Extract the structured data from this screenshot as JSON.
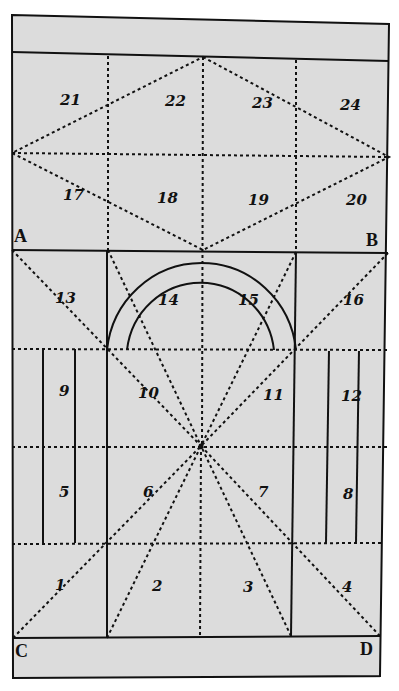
{
  "figure": {
    "paper_color": "#dcdcdc",
    "ink_color": "#111111",
    "page_background": "#ffffff",
    "corner_labels": [
      {
        "text": "A",
        "x": 14,
        "y": 242
      },
      {
        "text": "B",
        "x": 366,
        "y": 246
      },
      {
        "text": "C",
        "x": 15,
        "y": 657
      },
      {
        "text": "D",
        "x": 360,
        "y": 655
      }
    ],
    "region_labels": [
      {
        "text": "21",
        "x": 60,
        "y": 105
      },
      {
        "text": "22",
        "x": 165,
        "y": 106
      },
      {
        "text": "23",
        "x": 252,
        "y": 108
      },
      {
        "text": "24",
        "x": 340,
        "y": 110
      },
      {
        "text": "17",
        "x": 63,
        "y": 200
      },
      {
        "text": "18",
        "x": 157,
        "y": 203
      },
      {
        "text": "19",
        "x": 248,
        "y": 205
      },
      {
        "text": "20",
        "x": 346,
        "y": 205
      },
      {
        "text": "13",
        "x": 55,
        "y": 303
      },
      {
        "text": "14",
        "x": 158,
        "y": 305
      },
      {
        "text": "15",
        "x": 238,
        "y": 305
      },
      {
        "text": "16",
        "x": 343,
        "y": 305
      },
      {
        "text": "9",
        "x": 59,
        "y": 396
      },
      {
        "text": "10",
        "x": 138,
        "y": 398
      },
      {
        "text": "11",
        "x": 263,
        "y": 400
      },
      {
        "text": "12",
        "x": 341,
        "y": 401
      },
      {
        "text": "5",
        "x": 59,
        "y": 497
      },
      {
        "text": "6",
        "x": 143,
        "y": 497
      },
      {
        "text": "7",
        "x": 258,
        "y": 497
      },
      {
        "text": "8",
        "x": 343,
        "y": 499
      },
      {
        "text": "1",
        "x": 55,
        "y": 590
      },
      {
        "text": "2",
        "x": 152,
        "y": 591
      },
      {
        "text": "3",
        "x": 243,
        "y": 592
      },
      {
        "text": "4",
        "x": 342,
        "y": 592
      }
    ]
  }
}
